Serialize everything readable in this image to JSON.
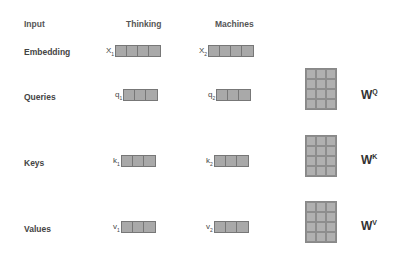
{
  "headers": {
    "input": "Input",
    "word1": "Thinking",
    "word2": "Machines"
  },
  "rows": [
    {
      "label": "Embedding",
      "v1": {
        "name": "X",
        "sub": "1",
        "cells": 4
      },
      "v2": {
        "name": "X",
        "sub": "2",
        "cells": 4
      }
    },
    {
      "label": "Queries",
      "v1": {
        "name": "q",
        "sub": "1",
        "cells": 3
      },
      "v2": {
        "name": "q",
        "sub": "2",
        "cells": 3
      },
      "weight": {
        "name": "W",
        "sup": "Q"
      }
    },
    {
      "label": "Keys",
      "v1": {
        "name": "k",
        "sub": "1",
        "cells": 3
      },
      "v2": {
        "name": "k",
        "sub": "2",
        "cells": 3
      },
      "weight": {
        "name": "W",
        "sup": "K"
      }
    },
    {
      "label": "Values",
      "v1": {
        "name": "v",
        "sub": "1",
        "cells": 3
      },
      "v2": {
        "name": "v",
        "sub": "2",
        "cells": 3
      },
      "weight": {
        "name": "W",
        "sup": "V"
      }
    }
  ],
  "colors": {
    "cell": "#a9a9a9",
    "border": "#777777"
  }
}
